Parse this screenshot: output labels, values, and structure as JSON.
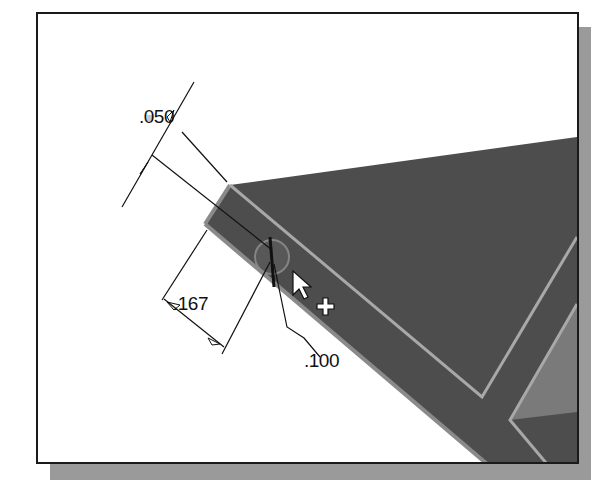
{
  "viewport": {
    "background": "#ffffff",
    "border_color": "#1a1a1a",
    "shadow_color": "#9a9a9a"
  },
  "model": {
    "face_color": "#4d4d4d",
    "edge_highlight_color": "#9a9a9a",
    "side_face_color": "#7a7a7a"
  },
  "dimensions": [
    {
      "id": "dim-050",
      "value": ".050"
    },
    {
      "id": "dim-167",
      "value": ".167"
    },
    {
      "id": "dim-100",
      "value": ".100"
    }
  ],
  "cursor": {
    "type": "arrow-with-plus",
    "icon": "arrow-pointer-icon",
    "modifier_icon": "plus-icon"
  }
}
